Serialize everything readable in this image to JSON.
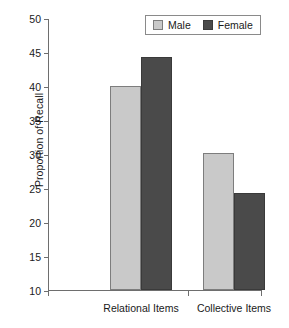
{
  "chart_data": {
    "type": "bar",
    "title": "",
    "subtitle": "",
    "xlabel": "",
    "ylabel": "Proportion of Recall",
    "categories": [
      "Relational Items",
      "Collective Items"
    ],
    "series": [
      {
        "name": "Male",
        "values": [
          40.0,
          30.2
        ],
        "color": "#c9c9c9"
      },
      {
        "name": "Female",
        "values": [
          44.2,
          24.2
        ],
        "color": "#4a4a4a"
      }
    ],
    "ylim": [
      10,
      50
    ],
    "yticks": [
      10,
      15,
      20,
      25,
      30,
      35,
      40,
      45,
      50
    ],
    "ytick_labels": [
      "10",
      "15",
      "20",
      "25",
      "30",
      "35",
      "40",
      "45",
      "50"
    ],
    "grid": false,
    "legend_position": "top-right",
    "legend_entries": [
      "Male",
      "Female"
    ]
  },
  "legend": {
    "male_label": "Male",
    "female_label": "Female"
  },
  "caption": {
    "fragment": ""
  }
}
